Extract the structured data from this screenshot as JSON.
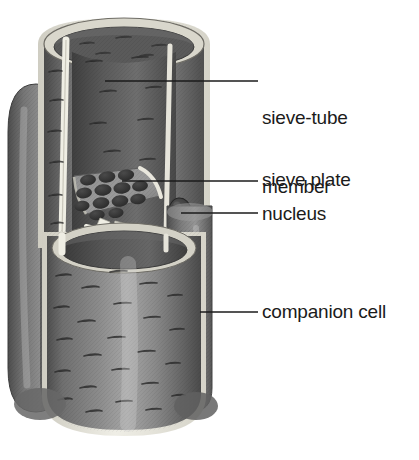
{
  "figure": {
    "kind": "biology-diagram",
    "background_color": "#ffffff",
    "line_color": "#1b1b1b",
    "text_color": "#1b1b1b"
  },
  "labels": [
    {
      "id": "sieve-tube-member",
      "text": "sieve-tube\nmember",
      "line1": "sieve-tube",
      "line2": "member",
      "leader": {
        "x1": 105,
        "y1": 81,
        "x2": 258,
        "y2": 81
      }
    },
    {
      "id": "sieve-plate",
      "text": "sieve plate",
      "line1": "sieve plate",
      "line2": "",
      "leader": {
        "x1": 122,
        "y1": 181,
        "x2": 258,
        "y2": 181
      }
    },
    {
      "id": "nucleus",
      "text": "nucleus",
      "line1": "nucleus",
      "line2": "",
      "leader": {
        "x1": 181,
        "y1": 213,
        "x2": 258,
        "y2": 213
      }
    },
    {
      "id": "companion-cell",
      "text": "companion cell",
      "line1": "companion cell",
      "line2": "",
      "leader": {
        "x1": 200,
        "y1": 312,
        "x2": 258,
        "y2": 312
      }
    }
  ],
  "structures": {
    "sieve_tube_upper": {
      "name": "sieve-tube member (upper)",
      "fill_dark": "#5d5d5d",
      "fill_mid": "#7a7a7a",
      "fill_light": "#a8a8a8",
      "wall_color": "#e8e6dd"
    },
    "sieve_tube_lower": {
      "name": "sieve-tube member (lower)",
      "fill_dark": "#575757",
      "fill_mid": "#787878",
      "fill_light": "#a2a2a2",
      "wall_color": "#e4e2d8"
    },
    "sieve_plate": {
      "name": "sieve plate",
      "pore_count": 13,
      "pore_color": "#3a3a3a",
      "plate_color": "#8a8a8a"
    },
    "nucleus": {
      "name": "nucleus",
      "color": "#3b3b3b"
    },
    "companion_cell_right": {
      "name": "companion cell (right)",
      "fill_light": "#c9c7bd",
      "fill_dark": "#6b6b6b"
    },
    "companion_cell_left": {
      "name": "companion cell (left)",
      "fill_light": "#8d8d8d",
      "fill_dark": "#4f4f4f"
    }
  }
}
